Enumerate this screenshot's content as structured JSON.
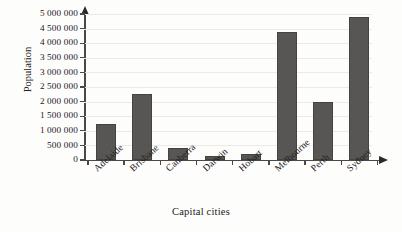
{
  "chart_data": {
    "type": "bar",
    "title": "",
    "xlabel": "Capital cities",
    "ylabel": "Population",
    "categories": [
      "Adelaide",
      "Brisbane",
      "Canberra",
      "Darwin",
      "Hobart",
      "Melbourne",
      "Perth",
      "Sydney"
    ],
    "values": [
      1250000,
      2250000,
      400000,
      130000,
      220000,
      4400000,
      2000000,
      4900000
    ],
    "ylim": [
      0,
      5000000
    ],
    "ytick_values": [
      0,
      500000,
      1000000,
      1500000,
      2000000,
      2500000,
      3000000,
      3500000,
      4000000,
      4500000,
      5000000
    ],
    "ytick_labels": [
      "0",
      "500 000",
      "1 000 000",
      "1 500 000",
      "2 000 000",
      "2 500 000",
      "3 000 000",
      "3 500 000",
      "4 000 000",
      "4 500 000",
      "5 000 000"
    ],
    "grid": true,
    "legend": false,
    "bar_color": "#585654",
    "axis_color": "#4c4845",
    "grid_color": "#ece9e6"
  }
}
